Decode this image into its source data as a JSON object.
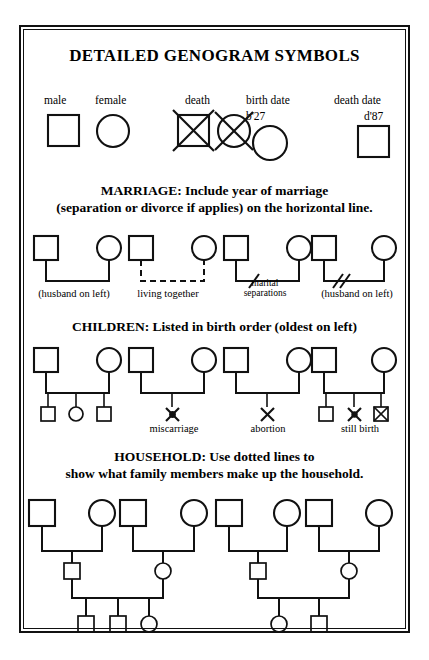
{
  "document": {
    "title": "DETAILED GENOGRAM SYMBOLS"
  },
  "basic_symbols": {
    "labels": {
      "male": "male",
      "female": "female",
      "death": "death",
      "birth_date": "birth date",
      "death_date": "death date"
    },
    "values": {
      "birth_year": "b'27",
      "death_year": "d'87"
    },
    "icons": {
      "male": "square-symbol",
      "female": "circle-symbol",
      "death_male": "crossed-square-symbol",
      "death_female": "crossed-circle-symbol",
      "birth_date_person": "circle-symbol",
      "death_date_person": "square-symbol"
    }
  },
  "marriage": {
    "heading_line1": "MARRIAGE: Include year of marriage",
    "heading_line2": "(separation or divorce if applies) on the horizontal line.",
    "examples": [
      {
        "label": "(husband on left)",
        "line_style": "solid",
        "marks": 0
      },
      {
        "label": "living together",
        "line_style": "dashed",
        "marks": 0
      },
      {
        "label_line1": "marital",
        "label_line2": "separations",
        "line_style": "solid",
        "marks": 1
      },
      {
        "label": "(husband on left)",
        "line_style": "solid",
        "marks": 2
      }
    ]
  },
  "children": {
    "heading": "CHILDREN: Listed in birth order (oldest on left)",
    "groups": [
      {
        "label": "",
        "offspring": [
          "square",
          "circle",
          "square"
        ]
      },
      {
        "label": "miscarriage",
        "offspring": [
          "miscarriage-x"
        ]
      },
      {
        "label": "abortion",
        "offspring": [
          "abortion-x"
        ]
      },
      {
        "label": "still birth",
        "offspring": [
          "square",
          "miscarriage-x",
          "stillbirth-crossed-square"
        ]
      }
    ]
  },
  "household": {
    "heading_line1": "HOUSEHOLD: Use dotted lines to",
    "heading_line2": "show what family members make up the household.",
    "units": [
      {
        "couples": [
          {
            "left": "square",
            "right": "circle"
          },
          {
            "left": "square",
            "right": "circle"
          }
        ],
        "middle_children": [
          "square",
          "circle"
        ],
        "grandchildren": [
          "square",
          "square",
          "circle"
        ]
      },
      {
        "couples": [
          {
            "left": "square",
            "right": "circle"
          },
          {
            "left": "square",
            "right": "circle"
          }
        ],
        "middle_children": [
          "square",
          "circle"
        ],
        "grandchildren": [
          "circle",
          "square"
        ]
      }
    ]
  },
  "colors": {
    "ink": "#111111",
    "paper": "#ffffff"
  }
}
